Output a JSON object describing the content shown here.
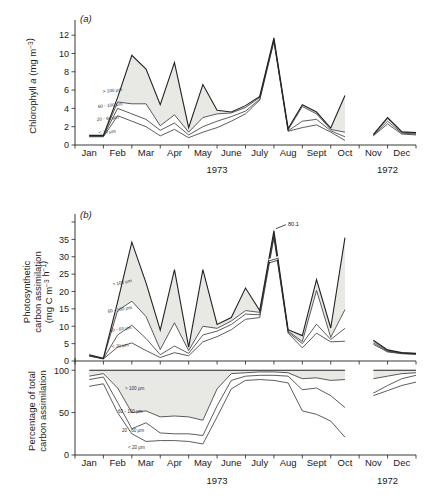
{
  "figure": {
    "panel_a_label": "(a)",
    "panel_b_label": "(b)",
    "axis_a_title_line1": "Chlorophyll a  (mg m",
    "axis_a_title_exp": "−3",
    "axis_a_title_end": ")",
    "axis_b_title_line1": "Photosynthetic",
    "axis_b_title_line2": "carbon assimilation",
    "axis_b_title_line3": "(mg C m",
    "axis_b_title_exp1": "−3",
    "axis_b_title_mid": " h",
    "axis_b_title_exp2": "−1",
    "axis_b_title_end": ")",
    "axis_c_title_line1": "Percentage of total",
    "axis_c_title_line2": "carbon assimilation",
    "annotation_peak": "80.1",
    "size_classes": [
      {
        "key": "gt100",
        "label": "> 100 μm"
      },
      {
        "key": "c60_100",
        "label": "60 - 100 μm"
      },
      {
        "key": "c20_60",
        "label": "20 - 60 μm"
      },
      {
        "key": "lt20",
        "label": "< 20 μm"
      }
    ],
    "colors": {
      "fill_shaded": "#e8e8e4",
      "line": "#333333",
      "axis": "#222222"
    }
  },
  "chart_data": [
    {
      "type": "area",
      "panel": "a",
      "title": "Chlorophyll a",
      "xlabel": "",
      "ylabel": "Chlorophyll a (mg m-3)",
      "ylim": [
        0,
        13
      ],
      "yticks": [
        0,
        2,
        4,
        6,
        8,
        10,
        12
      ],
      "grid": false,
      "legend": "inline",
      "x": [
        "Jan",
        "Jan.5",
        "Feb",
        "Feb.5",
        "Mar",
        "Mar.5",
        "Apr",
        "Apr.5",
        "May",
        "May.5",
        "June",
        "June.5",
        "July",
        "July.5",
        "Aug",
        "Aug.5",
        "Sept",
        "Sept.5",
        "Oct",
        "Nov",
        "Nov.5",
        "Dec",
        "Dec.5"
      ],
      "series": [
        {
          "name": "< 20 μm",
          "values": [
            0.9,
            0.9,
            3.2,
            2.6,
            2.0,
            1.0,
            1.7,
            0.8,
            1.4,
            1.9,
            2.6,
            3.4,
            4.9,
            11.3,
            1.5,
            1.9,
            2.2,
            1.4,
            0.5,
            1.0,
            2.3,
            1.2,
            1.1
          ]
        },
        {
          "name": "20 - 60 μm",
          "values": [
            0.95,
            0.95,
            4.0,
            3.4,
            2.8,
            1.6,
            2.4,
            1.1,
            2.0,
            2.6,
            3.1,
            3.7,
            5.0,
            11.4,
            1.55,
            2.6,
            2.8,
            1.55,
            0.9,
            1.05,
            2.6,
            1.3,
            1.2
          ]
        },
        {
          "name": "60 - 100 μm",
          "values": [
            1.0,
            1.0,
            4.7,
            4.5,
            4.5,
            2.1,
            3.3,
            1.4,
            3.0,
            3.4,
            3.5,
            4.1,
            5.2,
            11.5,
            1.65,
            4.2,
            3.4,
            1.7,
            1.4,
            1.1,
            2.9,
            1.4,
            1.3
          ]
        },
        {
          "name": "> 100 μm",
          "values": [
            1.05,
            1.05,
            5.2,
            9.8,
            8.3,
            4.4,
            9.0,
            1.9,
            6.6,
            3.8,
            3.6,
            4.3,
            5.3,
            11.7,
            1.8,
            4.4,
            3.6,
            1.85,
            5.4,
            1.15,
            3.0,
            1.45,
            1.35
          ]
        }
      ],
      "shaded_band": "> 100 μm",
      "break_between": [
        "Oct",
        "Nov"
      ]
    },
    {
      "type": "area",
      "panel": "b",
      "title": "Photosynthetic carbon assimilation",
      "xlabel": "",
      "ylabel": "Photosynthetic carbon assimilation (mg C m-3 h-1)",
      "ylim": [
        0,
        40
      ],
      "yticks": [
        0,
        5,
        10,
        15,
        20,
        25,
        30,
        35
      ],
      "grid": false,
      "legend": "inline",
      "annotations": [
        {
          "text": "80.1",
          "x": "July",
          "y": 36,
          "note": "axis break, true peak 80.1"
        }
      ],
      "x": [
        "Jan",
        "Jan.5",
        "Feb",
        "Feb.5",
        "Mar",
        "Mar.5",
        "Apr",
        "Apr.5",
        "May",
        "May.5",
        "June",
        "June.5",
        "July",
        "July.5",
        "Aug",
        "Aug.5",
        "Sept",
        "Sept.5",
        "Oct",
        "Nov",
        "Nov.5",
        "Dec",
        "Dec.5"
      ],
      "series": [
        {
          "name": "< 20 μm",
          "values": [
            1.4,
            0.6,
            4.0,
            5.2,
            3.0,
            1.0,
            2.4,
            1.5,
            5.5,
            7.0,
            9.0,
            12.0,
            12.5,
            35.5,
            8.0,
            3.8,
            8.0,
            5.5,
            5.7,
            4.8,
            2.6,
            2.1,
            1.9
          ]
        },
        {
          "name": "20 - 60 μm",
          "values": [
            1.5,
            0.65,
            7.5,
            10.3,
            6.5,
            1.8,
            4.3,
            2.2,
            7.5,
            8.6,
            10.5,
            13.5,
            13.3,
            36.0,
            8.3,
            5.0,
            10.6,
            6.2,
            9.4,
            5.2,
            2.8,
            2.2,
            2.0
          ]
        },
        {
          "name": "60 - 100 μm",
          "values": [
            1.6,
            0.7,
            14.5,
            17.2,
            12.8,
            3.3,
            11.0,
            3.0,
            10.0,
            9.4,
            11.5,
            14.5,
            14.0,
            36.5,
            8.6,
            5.6,
            20.3,
            6.8,
            14.8,
            5.7,
            3.0,
            2.3,
            2.1
          ]
        },
        {
          "name": "> 100 μm",
          "values": [
            1.8,
            0.8,
            17.0,
            34.2,
            22.5,
            8.9,
            26.3,
            4.0,
            26.3,
            10.5,
            12.5,
            21.0,
            14.5,
            37.5,
            9.0,
            7.3,
            23.4,
            9.5,
            35.5,
            6.0,
            3.2,
            2.4,
            2.2
          ]
        }
      ],
      "shaded_band": "> 100 μm",
      "break_between": [
        "Oct",
        "Nov"
      ]
    },
    {
      "type": "area",
      "panel": "c",
      "title": "Percentage of total carbon assimilation",
      "xlabel": "",
      "ylabel": "Percentage of total carbon assimilation",
      "ylim": [
        0,
        105
      ],
      "yticks": [
        0,
        50,
        100
      ],
      "grid": false,
      "legend": "inline",
      "x": [
        "Jan",
        "Jan.5",
        "Feb",
        "Feb.5",
        "Mar",
        "Mar.5",
        "Apr",
        "Apr.5",
        "May",
        "May.5",
        "June",
        "June.5",
        "July",
        "July.5",
        "Aug",
        "Aug.5",
        "Sept",
        "Sept.5",
        "Oct",
        "Nov",
        "Nov.5",
        "Dec",
        "Dec.5"
      ],
      "series": [
        {
          "name": "< 20 μm",
          "values": [
            81,
            84,
            50,
            25,
            16,
            17,
            17,
            16,
            13,
            45,
            78,
            88,
            89,
            88,
            85,
            52,
            48,
            40,
            21,
            70,
            76,
            82,
            86
          ]
        },
        {
          "name": "20 - 60 μm",
          "values": [
            89,
            92,
            62,
            31,
            38,
            26,
            25,
            25,
            23,
            58,
            88,
            93,
            94,
            94,
            93,
            77,
            79,
            70,
            56,
            73,
            82,
            90,
            94
          ]
        },
        {
          "name": "60 - 100 μm",
          "values": [
            93,
            96,
            79,
            50,
            52,
            45,
            46,
            45,
            41,
            78,
            96,
            97,
            98,
            98,
            97,
            90,
            91,
            88,
            89,
            90,
            93,
            96,
            97
          ]
        },
        {
          "name": "> 100 μm",
          "values": [
            100,
            100,
            100,
            100,
            100,
            100,
            100,
            100,
            100,
            100,
            100,
            100,
            100,
            100,
            100,
            100,
            100,
            100,
            100,
            100,
            100,
            100,
            100
          ]
        }
      ],
      "shaded_band": "> 100 μm",
      "break_between": [
        "Oct",
        "Nov"
      ]
    }
  ],
  "xaxis": {
    "months": [
      "Jan",
      "Feb",
      "Mar",
      "Apr",
      "May",
      "June",
      "July",
      "Aug",
      "Sept",
      "Oct",
      "Nov",
      "Dec"
    ],
    "year_left": "1973",
    "year_right": "1972"
  }
}
